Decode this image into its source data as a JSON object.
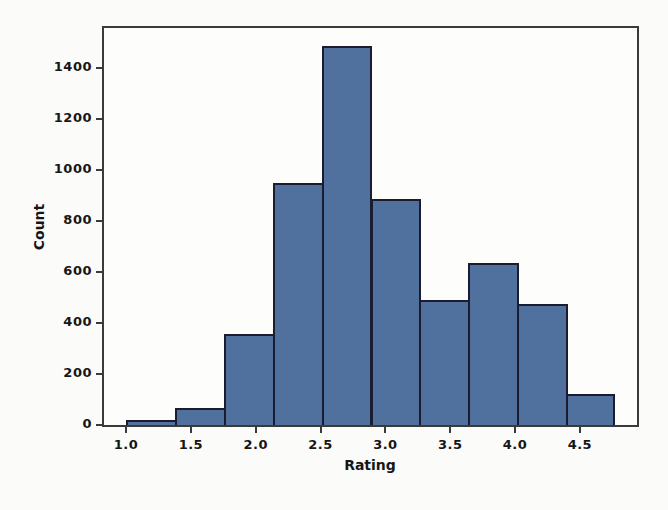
{
  "chart_data": {
    "type": "bar",
    "subtype": "histogram",
    "title": "",
    "xlabel": "Rating",
    "ylabel": "Count",
    "bin_edges": [
      1.0,
      1.377,
      1.754,
      2.131,
      2.508,
      2.885,
      3.262,
      3.639,
      4.016,
      4.393,
      4.77
    ],
    "values": [
      20,
      65,
      355,
      950,
      1485,
      885,
      490,
      635,
      475,
      120
    ],
    "x_tick_labels": [
      "1.0",
      "1.5",
      "2.0",
      "2.5",
      "3.0",
      "3.5",
      "4.0",
      "4.5"
    ],
    "x_tick_values": [
      1.0,
      1.5,
      2.0,
      2.5,
      3.0,
      3.5,
      4.0,
      4.5
    ],
    "y_tick_labels": [
      "0",
      "200",
      "400",
      "600",
      "800",
      "1000",
      "1200",
      "1400"
    ],
    "y_tick_values": [
      0,
      200,
      400,
      600,
      800,
      1000,
      1200,
      1400
    ],
    "xlim": [
      0.83,
      4.94
    ],
    "ylim": [
      0,
      1555
    ],
    "grid": false,
    "legend": null
  },
  "colors": {
    "bar_fill": "#50709e",
    "bar_edge": "#1c1c30",
    "spine": "#3a3a3a",
    "tick_text": "#161616",
    "page_background": "#fbfbf9",
    "plot_background": "#fdfdfc"
  }
}
